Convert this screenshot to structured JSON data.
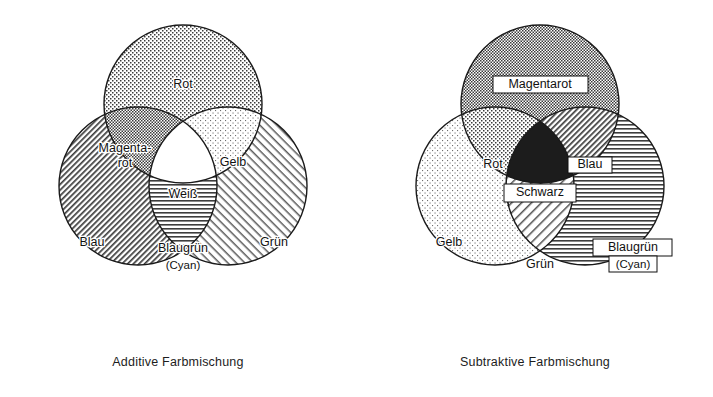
{
  "figure": {
    "title_additive": "Additive Farbmischung",
    "title_subtractive": "Subtraktive Farbmischung"
  },
  "additive": {
    "caption": "Additive Farbmischung",
    "circles": [
      {
        "key": "rot",
        "label": "Rot",
        "fill": "dots-medium",
        "cx": 183,
        "cy": 104,
        "r": 79
      },
      {
        "key": "blau",
        "label": "Blau",
        "fill": "hatch-rise-dense",
        "cx": 138,
        "cy": 186,
        "r": 79
      },
      {
        "key": "gruen",
        "label": "Grün",
        "fill": "hatch-fall-light",
        "cx": 228,
        "cy": 186,
        "r": 79
      }
    ],
    "regions": [
      {
        "key": "rot",
        "label": "Rot",
        "x": 183,
        "y": 85,
        "fill": "dots-medium"
      },
      {
        "key": "blau",
        "label": "Blau",
        "x": 92,
        "y": 243,
        "fill": "hatch-rise-dense"
      },
      {
        "key": "gruen",
        "label": "Grün",
        "x": 274,
        "y": 243,
        "fill": "hatch-fall-light"
      },
      {
        "key": "magentarot",
        "label": "Magenta-",
        "label2": "rot",
        "x": 125,
        "y": 155,
        "fill": "checker-dense"
      },
      {
        "key": "gelb",
        "label": "Gelb",
        "x": 233,
        "y": 163,
        "fill": "dots-light"
      },
      {
        "key": "blaugruen",
        "label": "Blaugrün",
        "label2": "(Cyan)",
        "x": 183,
        "y": 255,
        "fill": "lines-horizontal"
      },
      {
        "key": "weiss",
        "label": "Weiß",
        "x": 183,
        "y": 195,
        "fill": "white"
      }
    ]
  },
  "subtractive": {
    "caption": "Subtraktive Farbmischung",
    "circles": [
      {
        "key": "magentarot",
        "label": "Magentarot",
        "fill": "checker-dense",
        "cx": 183,
        "cy": 104,
        "r": 79
      },
      {
        "key": "gelb",
        "label": "Gelb",
        "fill": "dots-light",
        "cx": 138,
        "cy": 186,
        "r": 79
      },
      {
        "key": "blaugruen",
        "label": "Blaugrün",
        "fill": "lines-horizontal",
        "cx": 228,
        "cy": 186,
        "r": 79
      }
    ],
    "regions": [
      {
        "key": "magentarot",
        "label": "Magentarot",
        "x": 183,
        "y": 85,
        "fill": "checker-dense",
        "boxed": true
      },
      {
        "key": "gelb",
        "label": "Gelb",
        "x": 92,
        "y": 243,
        "fill": "dots-light"
      },
      {
        "key": "blaugruen",
        "label": "Blaugrün",
        "label2": "(Cyan)",
        "x": 276,
        "y": 248,
        "fill": "lines-horizontal",
        "boxed": true
      },
      {
        "key": "rot",
        "label": "Rot",
        "x": 136,
        "y": 165,
        "fill": "dots-medium"
      },
      {
        "key": "blau",
        "label": "Blau",
        "x": 233,
        "y": 165,
        "fill": "hatch-rise-dense",
        "boxed": true
      },
      {
        "key": "gruen",
        "label": "Grün",
        "x": 183,
        "y": 265,
        "fill": "hatch-rise-light"
      },
      {
        "key": "schwarz",
        "label": "Schwarz",
        "x": 183,
        "y": 193,
        "fill": "black",
        "boxed": true
      }
    ]
  },
  "colors": {
    "ink": "#1a1a1a",
    "paper": "#ffffff",
    "black_region": "#1c1c1c",
    "pattern_gray": "#4a4a4a"
  }
}
